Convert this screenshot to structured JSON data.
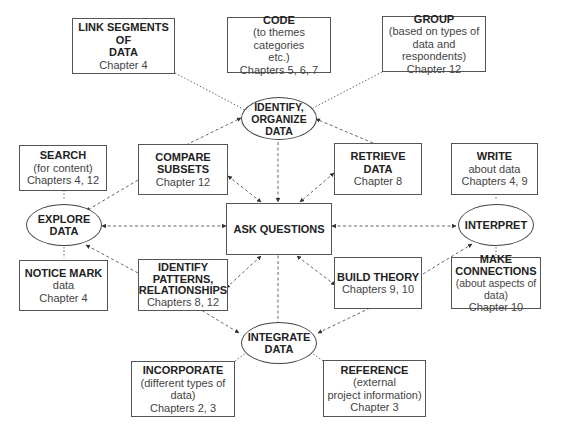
{
  "diagram": {
    "hubs": {
      "identify": {
        "lines": [
          "IDENTIFY,",
          "ORGANIZE",
          "DATA"
        ]
      },
      "explore": {
        "lines": [
          "EXPLORE",
          "DATA"
        ]
      },
      "interpret": {
        "lines": [
          "INTERPRET"
        ]
      },
      "integrate": {
        "lines": [
          "INTEGRATE",
          "DATA"
        ]
      },
      "ask": {
        "lines": [
          "ASK QUESTIONS"
        ]
      }
    },
    "boxes": {
      "link": {
        "title": [
          "LINK SEGMENTS OF",
          "DATA"
        ],
        "sub": [
          "Chapter 4"
        ]
      },
      "code": {
        "title": [
          "CODE"
        ],
        "sub": [
          "(to themes categories",
          "etc.)",
          "Chapters  5, 6, 7"
        ]
      },
      "group": {
        "title": [
          "GROUP"
        ],
        "sub": [
          "(based on types of",
          "data and respondents)",
          "Chapter 12"
        ]
      },
      "search": {
        "title": [
          "SEARCH"
        ],
        "sub": [
          "(for content)",
          "Chapters 4, 12"
        ]
      },
      "compare": {
        "title": [
          "COMPARE",
          "SUBSETS"
        ],
        "sub": [
          "Chapter 12"
        ]
      },
      "retrieve": {
        "title": [
          "RETRIEVE",
          "DATA"
        ],
        "sub": [
          "Chapter 8"
        ]
      },
      "write": {
        "title": [
          "WRITE"
        ],
        "sub": [
          "about data",
          "Chapters 4, 9"
        ]
      },
      "notice": {
        "title": [
          "NOTICE MARK"
        ],
        "sub": [
          "data",
          "Chapter 4"
        ]
      },
      "patterns": {
        "title": [
          "IDENTIFY",
          "PATTERNS,",
          "RELATIONSHIPS"
        ],
        "sub": [
          "Chapters 8, 12"
        ]
      },
      "theory": {
        "title": [
          "BUILD THEORY"
        ],
        "sub": [
          "Chapters 9, 10"
        ]
      },
      "connections": {
        "title": [
          "MAKE",
          "CONNECTIONS"
        ],
        "sub": [
          "(about aspects of data)",
          "Chapter 10"
        ]
      },
      "incorporate": {
        "title": [
          "INCORPORATE"
        ],
        "sub": [
          "(different types of data)",
          "Chapters 2, 3"
        ]
      },
      "reference": {
        "title": [
          "REFERENCE"
        ],
        "sub": [
          "(external",
          "project information)",
          "Chapter 3"
        ]
      }
    },
    "colors": {
      "line": "#555555",
      "border": "#555555",
      "text": "#222222"
    }
  }
}
